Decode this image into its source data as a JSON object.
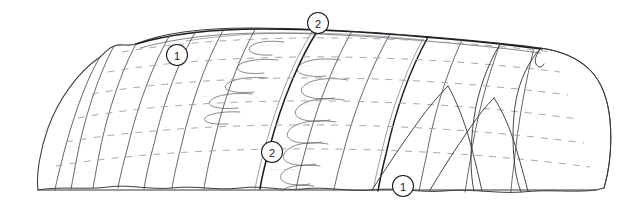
{
  "figure": {
    "background_color": "#ffffff",
    "width": 640,
    "height": 213,
    "line_color": "#3b3b40",
    "heavy_line_color": "#1e1e22",
    "dash_color": "#a3a3aa",
    "annotation_color": "#8d8d92"
  },
  "labels": [
    {
      "id": "label-1-upper-left",
      "text": "1",
      "cx": 177,
      "cy": 55,
      "r": 10.5
    },
    {
      "id": "label-2-top",
      "text": "2",
      "cx": 318,
      "cy": 23,
      "r": 10.5
    },
    {
      "id": "label-2-center",
      "text": "2",
      "cx": 272,
      "cy": 152,
      "r": 10.5
    },
    {
      "id": "label-1-lower-right",
      "text": "1",
      "cx": 403,
      "cy": 186,
      "r": 10.5
    }
  ],
  "annotations": [
    {
      "text": "~ ~~ ~~~ ~ ~~~",
      "x": 270,
      "y": 45,
      "rot": -5
    },
    {
      "text": "~~ ~ ~~~ ~ ~~~",
      "x": 248,
      "y": 62,
      "rot": -4
    },
    {
      "text": "~~~ ~~~ ~ ~~",
      "x": 236,
      "y": 78,
      "rot": -3
    },
    {
      "text": "~~~ ~ ~~~ ~~",
      "x": 214,
      "y": 96,
      "rot": -2
    },
    {
      "text": "~~~ ~~~ ~~~",
      "x": 302,
      "y": 66,
      "rot": -5
    },
    {
      "text": "~ ~~~ ~ ~~~ ~",
      "x": 316,
      "y": 84,
      "rot": -4
    },
    {
      "text": "~~~ ~~ ~ ~~~",
      "x": 308,
      "y": 105,
      "rot": -3
    },
    {
      "text": "~~~ ~ ~~~ ~~~",
      "x": 298,
      "y": 126,
      "rot": -2
    },
    {
      "text": "~~ ~~~ ~~~ ~",
      "x": 286,
      "y": 148,
      "rot": -1
    },
    {
      "text": "~~~ ~~ ~~ ~~~",
      "x": 283,
      "y": 170,
      "rot": 0
    },
    {
      "text": "~~ ~~~ ~~~",
      "x": 288,
      "y": 190,
      "rot": 0
    }
  ],
  "legend": {
    "generation_1": "1",
    "generation_2": "2"
  }
}
